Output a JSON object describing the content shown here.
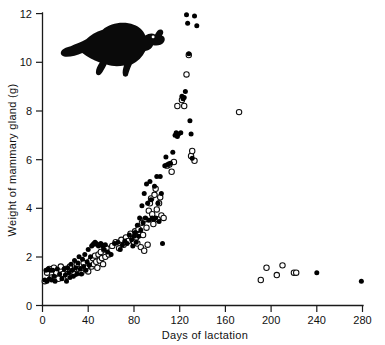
{
  "figure": {
    "title": "",
    "animal_icon": "possum-silhouette"
  },
  "axes": {
    "x_title": "Days of lactation",
    "y_title": "Weight of mammary gland (g)",
    "x_ticks": [
      "0",
      "40",
      "80",
      "120",
      "160",
      "200",
      "240",
      "280"
    ],
    "y_ticks": [
      "0",
      "2",
      "4",
      "6",
      "8",
      "10",
      "12"
    ]
  },
  "legend": {
    "filled_label": "filled circle",
    "open_label": "open circle"
  },
  "chart_data": {
    "type": "scatter",
    "title": "",
    "xlabel": "Days of lactation",
    "ylabel": "Weight of mammary gland (g)",
    "xlim": [
      0,
      280
    ],
    "ylim": [
      0,
      12
    ],
    "xticks": [
      0,
      40,
      80,
      120,
      160,
      200,
      240,
      280
    ],
    "yticks": [
      0,
      2,
      4,
      6,
      8,
      10,
      12
    ],
    "grid": false,
    "legend_position": "none",
    "series": [
      {
        "name": "filled",
        "marker": "filled-circle",
        "color": "#000000",
        "points": [
          [
            2,
            1.05
          ],
          [
            3,
            1.45
          ],
          [
            4,
            1.0
          ],
          [
            5,
            1.5
          ],
          [
            6,
            1.1
          ],
          [
            7,
            1.45
          ],
          [
            8,
            1.05
          ],
          [
            9,
            1.45
          ],
          [
            10,
            1.2
          ],
          [
            11,
            1.0
          ],
          [
            13,
            1.5
          ],
          [
            15,
            1.3
          ],
          [
            17,
            1.1
          ],
          [
            19,
            1.5
          ],
          [
            20,
            1.25
          ],
          [
            21,
            1.0
          ],
          [
            22,
            1.55
          ],
          [
            23,
            1.35
          ],
          [
            24,
            1.15
          ],
          [
            25,
            1.7
          ],
          [
            26,
            1.45
          ],
          [
            27,
            1.2
          ],
          [
            28,
            1.85
          ],
          [
            29,
            1.55
          ],
          [
            30,
            1.3
          ],
          [
            31,
            1.75
          ],
          [
            32,
            2.0
          ],
          [
            33,
            1.5
          ],
          [
            34,
            1.3
          ],
          [
            35,
            1.9
          ],
          [
            36,
            1.6
          ],
          [
            37,
            2.1
          ],
          [
            38,
            1.45
          ],
          [
            39,
            1.8
          ],
          [
            40,
            2.3
          ],
          [
            41,
            1.65
          ],
          [
            42,
            2.0
          ],
          [
            43,
            2.45
          ],
          [
            44,
            2.5
          ],
          [
            45,
            2.55
          ],
          [
            46,
            2.6
          ],
          [
            47,
            2.55
          ],
          [
            48,
            2.5
          ],
          [
            49,
            2.45
          ],
          [
            50,
            2.5
          ],
          [
            51,
            2.55
          ],
          [
            52,
            2.5
          ],
          [
            53,
            2.45
          ],
          [
            54,
            2.3
          ],
          [
            55,
            2.5
          ],
          [
            57,
            2.2
          ],
          [
            60,
            2.1
          ],
          [
            63,
            2.55
          ],
          [
            66,
            2.6
          ],
          [
            68,
            2.3
          ],
          [
            70,
            2.5
          ],
          [
            72,
            2.65
          ],
          [
            74,
            2.55
          ],
          [
            76,
            2.9
          ],
          [
            78,
            2.7
          ],
          [
            79,
            2.45
          ],
          [
            80,
            2.85
          ],
          [
            81,
            3.0
          ],
          [
            82,
            2.6
          ],
          [
            83,
            3.3
          ],
          [
            84,
            2.85
          ],
          [
            85,
            3.6
          ],
          [
            86,
            3.1
          ],
          [
            87,
            4.1
          ],
          [
            88,
            3.4
          ],
          [
            89,
            4.6
          ],
          [
            90,
            3.6
          ],
          [
            91,
            5.0
          ],
          [
            92,
            4.2
          ],
          [
            93,
            3.5
          ],
          [
            94,
            5.1
          ],
          [
            95,
            4.35
          ],
          [
            96,
            3.6
          ],
          [
            97,
            3.55
          ],
          [
            98,
            4.9
          ],
          [
            99,
            3.6
          ],
          [
            100,
            5.3
          ],
          [
            101,
            4.2
          ],
          [
            102,
            3.45
          ],
          [
            103,
            5.3
          ],
          [
            104,
            4.6
          ],
          [
            105,
            2.55
          ],
          [
            107,
            5.75
          ],
          [
            108,
            6.1
          ],
          [
            110,
            5.8
          ],
          [
            112,
            5.85
          ],
          [
            114,
            6.3
          ],
          [
            116,
            7.0
          ],
          [
            117,
            7.1
          ],
          [
            118,
            6.95
          ],
          [
            119,
            7.05
          ],
          [
            121,
            7.1
          ],
          [
            122,
            8.6
          ],
          [
            123,
            8.5
          ],
          [
            124,
            8.55
          ],
          [
            125,
            8.8
          ],
          [
            126,
            11.95
          ],
          [
            127,
            11.6
          ],
          [
            128,
            10.35
          ],
          [
            129,
            7.6
          ],
          [
            130,
            7.05
          ],
          [
            131,
            6.05
          ],
          [
            133,
            11.9
          ],
          [
            135,
            11.5
          ],
          [
            240,
            1.35
          ],
          [
            279,
            1.0
          ]
        ]
      },
      {
        "name": "open",
        "marker": "open-circle",
        "color": "#ffffff",
        "points": [
          [
            2,
            1.0
          ],
          [
            4,
            1.35
          ],
          [
            6,
            1.5
          ],
          [
            8,
            1.15
          ],
          [
            10,
            1.55
          ],
          [
            12,
            1.35
          ],
          [
            14,
            1.1
          ],
          [
            16,
            1.6
          ],
          [
            18,
            1.3
          ],
          [
            20,
            1.5
          ],
          [
            22,
            1.2
          ],
          [
            24,
            1.6
          ],
          [
            26,
            1.4
          ],
          [
            28,
            1.3
          ],
          [
            30,
            1.7
          ],
          [
            32,
            1.5
          ],
          [
            34,
            1.35
          ],
          [
            36,
            1.75
          ],
          [
            38,
            1.55
          ],
          [
            40,
            1.4
          ],
          [
            42,
            1.85
          ],
          [
            43,
            1.6
          ],
          [
            44,
            1.95
          ],
          [
            45,
            1.7
          ],
          [
            46,
            2.05
          ],
          [
            47,
            1.8
          ],
          [
            48,
            1.55
          ],
          [
            49,
            2.1
          ],
          [
            50,
            1.85
          ],
          [
            51,
            2.2
          ],
          [
            52,
            1.95
          ],
          [
            53,
            1.7
          ],
          [
            54,
            2.3
          ],
          [
            55,
            2.0
          ],
          [
            56,
            2.35
          ],
          [
            58,
            2.1
          ],
          [
            61,
            2.45
          ],
          [
            64,
            2.6
          ],
          [
            67,
            2.35
          ],
          [
            69,
            2.7
          ],
          [
            71,
            2.5
          ],
          [
            73,
            2.8
          ],
          [
            75,
            2.65
          ],
          [
            77,
            2.95
          ],
          [
            79,
            2.75
          ],
          [
            80,
            2.6
          ],
          [
            81,
            3.05
          ],
          [
            82,
            2.8
          ],
          [
            83,
            2.55
          ],
          [
            84,
            3.15
          ],
          [
            85,
            2.9
          ],
          [
            86,
            2.4
          ],
          [
            87,
            3.4
          ],
          [
            88,
            2.9
          ],
          [
            89,
            2.25
          ],
          [
            90,
            3.55
          ],
          [
            91,
            3.2
          ],
          [
            92,
            2.5
          ],
          [
            93,
            3.9
          ],
          [
            94,
            4.2
          ],
          [
            95,
            4.4
          ],
          [
            96,
            3.75
          ],
          [
            97,
            3.35
          ],
          [
            98,
            4.55
          ],
          [
            99,
            4.8
          ],
          [
            100,
            3.95
          ],
          [
            101,
            3.55
          ],
          [
            102,
            4.2
          ],
          [
            103,
            4.45
          ],
          [
            104,
            3.7
          ],
          [
            106,
            3.6
          ],
          [
            109,
            5.75
          ],
          [
            111,
            5.8
          ],
          [
            113,
            5.5
          ],
          [
            115,
            5.9
          ],
          [
            118,
            8.2
          ],
          [
            122,
            8.45
          ],
          [
            124,
            8.2
          ],
          [
            126,
            9.5
          ],
          [
            128,
            10.3
          ],
          [
            130,
            6.15
          ],
          [
            131,
            6.35
          ],
          [
            133,
            5.95
          ],
          [
            172,
            7.95
          ],
          [
            191,
            1.05
          ],
          [
            196,
            1.55
          ],
          [
            205,
            1.25
          ],
          [
            210,
            1.65
          ],
          [
            220,
            1.35
          ],
          [
            222,
            1.35
          ]
        ]
      }
    ]
  }
}
